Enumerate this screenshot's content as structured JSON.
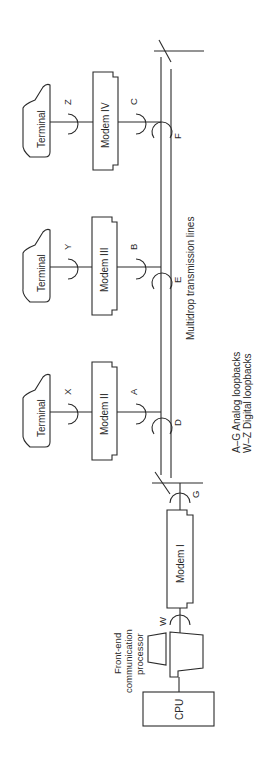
{
  "diagram": {
    "orientation": "rotated-90-ccw",
    "cpu_label": "CPU",
    "fep_label_lines": [
      "Front-end",
      "communication",
      "processor"
    ],
    "modems": [
      {
        "id": "modem-1",
        "label": "Modem I"
      },
      {
        "id": "modem-2",
        "label": "Modem II"
      },
      {
        "id": "modem-3",
        "label": "Modem III"
      },
      {
        "id": "modem-4",
        "label": "Modem IV"
      }
    ],
    "terminals": [
      {
        "id": "terminal-2",
        "label": "Terminal"
      },
      {
        "id": "terminal-3",
        "label": "Terminal"
      },
      {
        "id": "terminal-4",
        "label": "Terminal"
      }
    ],
    "loopbacks": {
      "analog": [
        "A",
        "B",
        "C",
        "D",
        "E",
        "F",
        "G"
      ],
      "digital": [
        "W",
        "X",
        "Y",
        "Z"
      ]
    },
    "line_label": "Multidrop transmission lines",
    "legend": {
      "analog": "A–G Analog loopbacks",
      "digital": "W–Z Digital loopbacks"
    }
  }
}
